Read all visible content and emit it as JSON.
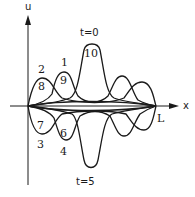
{
  "diagram": {
    "axes": {
      "y_label": "u",
      "x_label": "x",
      "end_label": "L"
    },
    "time_labels": {
      "top": "t=0",
      "bottom": "t=5"
    },
    "curve_labels": {
      "c1": "1",
      "c2": "2",
      "c3": "3",
      "c4": "4",
      "c6": "6",
      "c7": "7",
      "c8": "8",
      "c9": "9",
      "c10": "10"
    }
  }
}
